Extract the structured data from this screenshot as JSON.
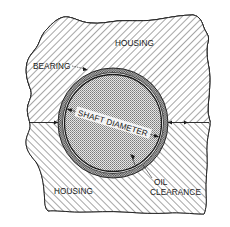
{
  "diagram": {
    "type": "bearing-cross-section",
    "labels": {
      "housing_top": "HOUSING",
      "housing_bottom": "HOUSING",
      "bearing": "BEARING",
      "shaft_diameter": "SHAFT DIAMETER",
      "oil_line1": "OIL",
      "oil_line2": "CLEARANCE"
    },
    "colors": {
      "line": "#1a1a1a",
      "background": "#ffffff",
      "hatch": "#3a3a3a",
      "shaft_fill": "#c8c8c8",
      "bearing_fill": "#9a9a9a"
    }
  }
}
